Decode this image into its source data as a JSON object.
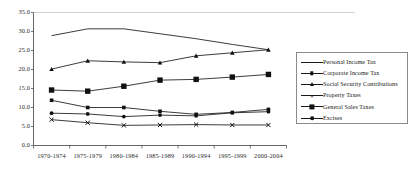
{
  "chart_data": {
    "type": "line",
    "title": "",
    "subtitle": "",
    "xlabel": "",
    "ylabel": "",
    "categories": [
      "1970-1974",
      "1975-1979",
      "1980-1984",
      "1985-1989",
      "1990-1994",
      "1995-1999",
      "2000-2004"
    ],
    "ylim": [
      0.0,
      35.0
    ],
    "ytick_labels": [
      "0.0",
      "5.0",
      "10.0",
      "15.0",
      "20.0",
      "25.0",
      "30.0",
      "35.0"
    ],
    "ytick_values": [
      0.0,
      5.0,
      10.0,
      15.0,
      20.0,
      25.0,
      30.0,
      35.0
    ],
    "grid": "top-gridline-only",
    "legend_position": "right",
    "series": [
      {
        "name": "Personal Income Tax",
        "marker": "none",
        "values": [
          28.9,
          30.7,
          30.7,
          29.4,
          28.1,
          26.6,
          25.2
        ]
      },
      {
        "name": "Corporate Income Tax",
        "marker": "square-small",
        "values": [
          11.9,
          10.0,
          10.0,
          9.0,
          8.2,
          8.7,
          9.5
        ]
      },
      {
        "name": "Social Security Contributions",
        "marker": "triangle",
        "values": [
          20.1,
          22.3,
          22.0,
          21.8,
          23.6,
          24.4,
          25.2
        ]
      },
      {
        "name": "Property Taxes",
        "marker": "x",
        "values": [
          6.8,
          6.0,
          5.3,
          5.4,
          5.5,
          5.4,
          5.4
        ]
      },
      {
        "name": "General Sales Taxes",
        "marker": "square-large",
        "values": [
          14.6,
          14.3,
          15.6,
          17.2,
          17.4,
          18.0,
          18.7
        ]
      },
      {
        "name": "Excises",
        "marker": "dot",
        "values": [
          8.5,
          8.3,
          7.6,
          8.0,
          7.8,
          8.6,
          8.9
        ]
      }
    ],
    "colors": {
      "line": "#1a1a1a",
      "marker": "#111111",
      "axis": "#555555",
      "gridline": "#cccccc",
      "text": "#2b2b2b",
      "background": "#ffffff"
    }
  }
}
